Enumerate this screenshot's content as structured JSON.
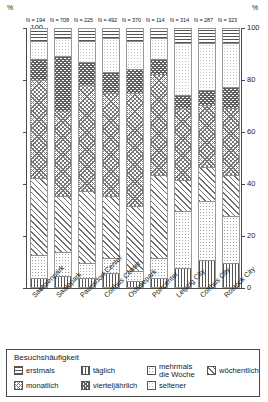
{
  "axis": {
    "unit_left": "%",
    "unit_right": "%",
    "ticks": [
      0,
      20,
      40,
      60,
      80,
      100
    ],
    "ylim": [
      0,
      100
    ]
  },
  "legend": {
    "title": "Besuchshäufigkeit",
    "items": [
      {
        "key": "erstmals",
        "label": "erstmals",
        "label2": ""
      },
      {
        "key": "taeglich",
        "label": "täglich",
        "label2": ""
      },
      {
        "key": "mehrmals",
        "label": "mehrmals",
        "label2": "die Woche"
      },
      {
        "key": "woechentlich",
        "label": "wöchentlich",
        "label2": ""
      },
      {
        "key": "monatlich",
        "label": "monatlich",
        "label2": ""
      },
      {
        "key": "vierteljaehrlich",
        "label": "vierteljährlich",
        "label2": ""
      },
      {
        "key": "seltener",
        "label": "seltener",
        "label2": ""
      }
    ]
  },
  "chart_data": {
    "type": "bar",
    "stacked": true,
    "normalized_percent": true,
    "title": "",
    "xlabel": "",
    "ylabel": "%",
    "ylim": [
      0,
      100
    ],
    "grid": false,
    "legend_position": "bottom",
    "categories": [
      "Sachsenpark",
      "Saalepark",
      "Paunsdorf Center",
      "Cottbus Center",
      "Ostseepark",
      "Portcenter",
      "Leipzig City",
      "Cottbus City",
      "Rostock City"
    ],
    "sample_sizes": [
      "N = 194",
      "N = 708",
      "N = 225",
      "N = 492",
      "N = 370",
      "N = 114",
      "N = 314",
      "N = 287",
      "N = 323"
    ],
    "stack_order_bottom_to_top": [
      "taeglich",
      "mehrmals",
      "woechentlich",
      "monatlich",
      "vierteljaehrlich",
      "seltener",
      "erstmals"
    ],
    "series": [
      {
        "name": "täglich",
        "key": "taeglich",
        "values": [
          3,
          4,
          3,
          5,
          2,
          3,
          7,
          10,
          9
        ]
      },
      {
        "name": "mehrmals die Woche",
        "key": "mehrmals",
        "values": [
          9,
          9,
          6,
          6,
          4,
          8,
          22,
          23,
          18
        ]
      },
      {
        "name": "wöchentlich",
        "key": "woechentlich",
        "values": [
          30,
          22,
          28,
          24,
          25,
          32,
          12,
          13,
          16
        ]
      },
      {
        "name": "monatlich",
        "key": "monatlich",
        "values": [
          38,
          33,
          41,
          40,
          44,
          39,
          28,
          24,
          26
        ]
      },
      {
        "name": "vierteljährlich",
        "key": "vierteljaehrlich",
        "values": [
          8,
          21,
          9,
          8,
          9,
          6,
          5,
          6,
          8
        ]
      },
      {
        "name": "seltener",
        "key": "seltener",
        "values": [
          7,
          7,
          8,
          13,
          11,
          8,
          20,
          18,
          17
        ]
      },
      {
        "name": "erstmals",
        "key": "erstmals",
        "values": [
          5,
          4,
          5,
          4,
          5,
          4,
          6,
          6,
          6
        ]
      }
    ]
  }
}
